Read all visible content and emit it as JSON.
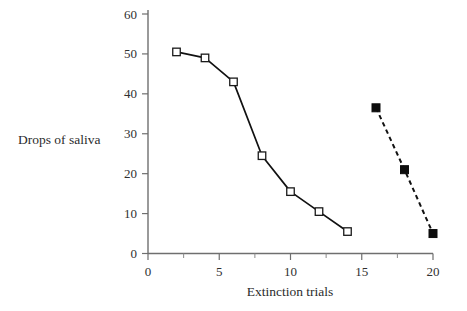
{
  "chart_data": {
    "type": "line",
    "title": "",
    "subtitle": "",
    "xlabel": "Extinction trials",
    "ylabel": "Drops of saliva",
    "xlim": [
      0,
      20
    ],
    "ylim": [
      0,
      60
    ],
    "xticks": [
      0,
      5,
      10,
      15,
      20
    ],
    "xtick_labels": [
      "0",
      "5",
      "10",
      "15",
      "20"
    ],
    "x_minor_ticks": [
      2.5,
      7.5,
      12.5,
      17.5
    ],
    "yticks": [
      0,
      10,
      20,
      30,
      40,
      50,
      60
    ],
    "ytick_labels": [
      "0",
      "10",
      "20",
      "30",
      "40",
      "50",
      "60"
    ],
    "grid": false,
    "legend": "none",
    "series": [
      {
        "name": "extinction-solid",
        "line_style": "solid",
        "marker": "open-square",
        "color": "#111111",
        "x": [
          2,
          4,
          6,
          8,
          10,
          12,
          14
        ],
        "values": [
          50.5,
          49,
          43,
          24.5,
          15.5,
          10.5,
          5.5
        ]
      },
      {
        "name": "extinction-dashed",
        "line_style": "dashed",
        "marker": "filled-square",
        "color": "#0d0d0d",
        "x": [
          16,
          18,
          20
        ],
        "values": [
          36.5,
          21,
          5
        ]
      }
    ]
  },
  "figure": {
    "background_color": "#ffffff",
    "axis_color": "#6f6f6f",
    "text_color": "#2b2b2b"
  }
}
